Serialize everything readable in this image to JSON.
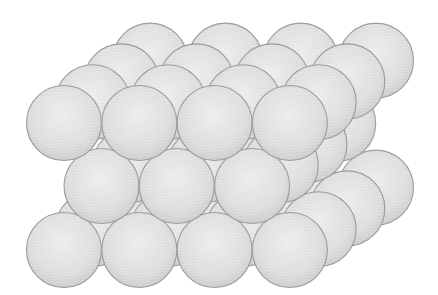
{
  "diagram": {
    "type": "sphere-packing",
    "canvas": {
      "width": 438,
      "height": 295,
      "background": "#ffffff"
    },
    "sphere_radius": 37.5,
    "colors": {
      "fill_light": "#ececec",
      "fill_mid": "#dcdcdc",
      "fill_dark": "#c9c9c9",
      "stroke": "#9c9c9c"
    },
    "depth_offset": {
      "dx": 28.7,
      "dy": -20.8
    },
    "layers": [
      {
        "name": "bottom-layer",
        "origin": {
          "x": 64,
          "y": 250
        },
        "columns": 4,
        "rows": 4,
        "spacing": 75.3
      },
      {
        "name": "middle-layer",
        "origin": {
          "x": 101.5,
          "y": 186
        },
        "columns": 3,
        "rows": 4,
        "spacing": 75.3
      },
      {
        "name": "top-layer",
        "origin": {
          "x": 64,
          "y": 123
        },
        "columns": 4,
        "rows": 4,
        "spacing": 75.3
      }
    ]
  }
}
